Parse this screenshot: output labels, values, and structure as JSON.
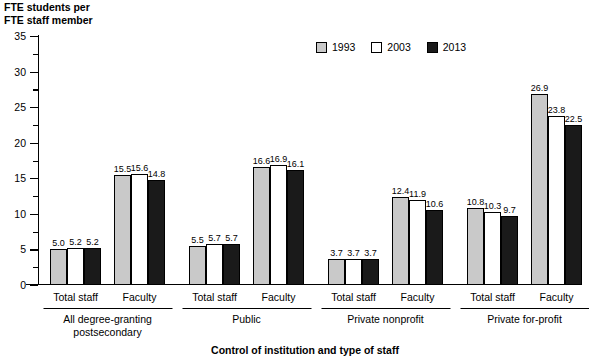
{
  "chart_data": {
    "type": "bar",
    "title": "",
    "ylabel": "FTE students per\nFTE staff member",
    "xlabel": "Control of institution and type of staff",
    "ylim": [
      0,
      35
    ],
    "ytick_step": 5,
    "yticks": [
      "0",
      "5",
      "10",
      "15",
      "20",
      "25",
      "30",
      "35"
    ],
    "grid": false,
    "legend_position": "top-center",
    "series": [
      {
        "name": "1993",
        "color": "#c9c9c9"
      },
      {
        "name": "2003",
        "color": "#ffffff"
      },
      {
        "name": "2013",
        "color": "#1a1a1a"
      }
    ],
    "groups": [
      {
        "label": "All degree-granting\npostsecondary",
        "subgroups": [
          {
            "label": "Total staff",
            "values": [
              5.0,
              5.2,
              5.2
            ]
          },
          {
            "label": "Faculty",
            "values": [
              15.5,
              15.6,
              14.8
            ]
          }
        ]
      },
      {
        "label": "Public",
        "subgroups": [
          {
            "label": "Total staff",
            "values": [
              5.5,
              5.7,
              5.7
            ]
          },
          {
            "label": "Faculty",
            "values": [
              16.6,
              16.9,
              16.1
            ]
          }
        ]
      },
      {
        "label": "Private nonprofit",
        "subgroups": [
          {
            "label": "Total staff",
            "values": [
              3.7,
              3.7,
              3.7
            ]
          },
          {
            "label": "Faculty",
            "values": [
              12.4,
              11.9,
              10.6
            ]
          }
        ]
      },
      {
        "label": "Private for-profit",
        "subgroups": [
          {
            "label": "Total staff",
            "values": [
              10.8,
              10.3,
              9.7
            ]
          },
          {
            "label": "Faculty",
            "values": [
              26.9,
              23.8,
              22.5
            ]
          }
        ]
      }
    ]
  }
}
